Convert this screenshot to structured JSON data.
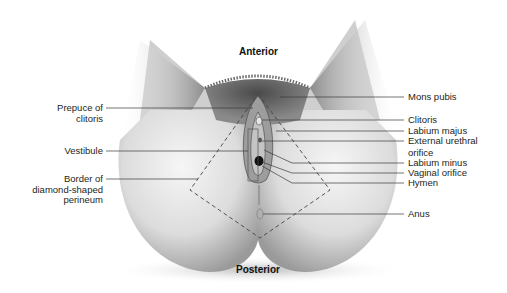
{
  "figure": {
    "orientation": {
      "top": "Anterior",
      "bottom": "Posterior"
    },
    "labels_left": [
      {
        "id": "prepuce",
        "line1": "Prepuce of",
        "line2": "clitoris"
      },
      {
        "id": "vestibule",
        "line1": "Vestibule",
        "line2": ""
      },
      {
        "id": "border",
        "line1": "Border of",
        "line2": "diamond-shaped",
        "line3": "perineum"
      }
    ],
    "labels_right": [
      {
        "id": "mons",
        "line1": "Mons pubis"
      },
      {
        "id": "clitoris",
        "line1": "Clitoris"
      },
      {
        "id": "labium-majus",
        "line1": "Labium majus"
      },
      {
        "id": "urethral",
        "line1": "External urethral",
        "line2": "orifice"
      },
      {
        "id": "labium-minus",
        "line1": "Labium minus"
      },
      {
        "id": "vaginal",
        "line1": "Vaginal orifice"
      },
      {
        "id": "hymen",
        "line1": "Hymen"
      },
      {
        "id": "anus",
        "line1": "Anus"
      }
    ],
    "colors": {
      "text": "#231f20",
      "leader": "#3a3a3a",
      "dashed_border": "#444444"
    }
  }
}
